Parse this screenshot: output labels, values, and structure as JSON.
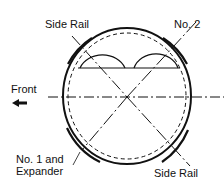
{
  "diagram": {
    "labels": {
      "side_rail_top": "Side Rail",
      "no2": "No. 2",
      "front": "Front",
      "no1_line1": "No. 1 and",
      "no1_line2": "Expander",
      "side_rail_bottom": "Side Rail"
    },
    "icons": {
      "front_arrow": "arrow-left-icon"
    },
    "colors": {
      "stroke": "#111111",
      "background": "#ffffff"
    }
  }
}
